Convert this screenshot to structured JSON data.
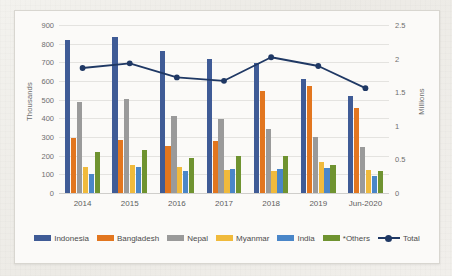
{
  "chart_data": {
    "type": "bar",
    "title": "",
    "subtitle": "",
    "xlabel": "",
    "ylabel": "Thousands",
    "ylabel_secondary": "Millions",
    "grid": true,
    "legend_position": "bottom",
    "categories": [
      "2014",
      "2015",
      "2016",
      "2017",
      "2018",
      "2019",
      "Jun-2020"
    ],
    "ylim": [
      0,
      900
    ],
    "yticks": [
      "0",
      "100",
      "200",
      "300",
      "400",
      "500",
      "600",
      "700",
      "800",
      "900"
    ],
    "ylim_secondary": [
      0,
      2.5
    ],
    "yticks_secondary": [
      "0",
      "0.5",
      "1",
      "1.5",
      "2",
      "2.5"
    ],
    "series": [
      {
        "name": "Indonesia",
        "color": "#3f5b96",
        "axis": "left",
        "values": [
          818,
          836,
          760,
          718,
          695,
          610,
          518
        ]
      },
      {
        "name": "Bangladesh",
        "color": "#e2761f",
        "axis": "left",
        "values": [
          297,
          286,
          253,
          280,
          545,
          572,
          455
        ]
      },
      {
        "name": "Nepal",
        "color": "#9a9a9a",
        "axis": "left",
        "values": [
          490,
          502,
          410,
          395,
          345,
          300,
          245
        ]
      },
      {
        "name": "Myanmar",
        "color": "#f0ba3c",
        "axis": "left",
        "values": [
          142,
          148,
          138,
          122,
          120,
          165,
          125
        ]
      },
      {
        "name": "India",
        "color": "#4a86c8",
        "axis": "left",
        "values": [
          103,
          140,
          120,
          130,
          130,
          135,
          90
        ]
      },
      {
        "name": "*Others",
        "color": "#6f9330",
        "axis": "left",
        "values": [
          220,
          230,
          190,
          196,
          200,
          150,
          120
        ]
      },
      {
        "name": "Total",
        "color": "#1f3864",
        "axis": "right",
        "type": "line",
        "values": [
          1.86,
          1.93,
          1.72,
          1.67,
          2.02,
          1.89,
          1.56
        ]
      }
    ]
  },
  "legend": {
    "items": [
      {
        "label": "Indonesia",
        "color": "#3f5b96",
        "kind": "swatch"
      },
      {
        "label": "Bangladesh",
        "color": "#e2761f",
        "kind": "swatch"
      },
      {
        "label": "Nepal",
        "color": "#9a9a9a",
        "kind": "swatch"
      },
      {
        "label": "Myanmar",
        "color": "#f0ba3c",
        "kind": "swatch"
      },
      {
        "label": "India",
        "color": "#4a86c8",
        "kind": "swatch"
      },
      {
        "label": "*Others",
        "color": "#6f9330",
        "kind": "swatch"
      },
      {
        "label": "Total",
        "color": "#1f3864",
        "kind": "line"
      }
    ]
  }
}
